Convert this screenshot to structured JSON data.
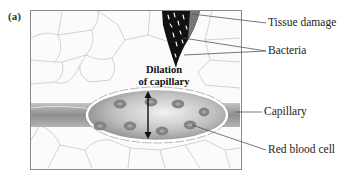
{
  "figure": {
    "panel_label": "(a)",
    "annotation_center": [
      "Dilation",
      "of capillary"
    ],
    "callouts": [
      {
        "id": "tissue-damage",
        "label": "Tissue damage"
      },
      {
        "id": "bacteria",
        "label": "Bacteria"
      },
      {
        "id": "capillary",
        "label": "Capillary"
      },
      {
        "id": "red-blood-cell",
        "label": "Red blood cell"
      }
    ]
  },
  "colors": {
    "tissue_lines": "#c8c8c8",
    "capillary_fill": "#9a9a9a",
    "rbc": "#7a7a7a",
    "wound": "#111111"
  }
}
